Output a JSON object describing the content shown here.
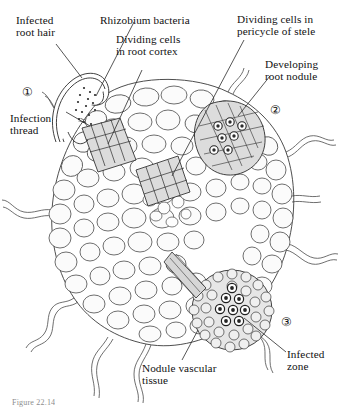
{
  "figure": {
    "domain": "biological-diagram",
    "caption": "Figure 22.14",
    "line_color": "#2b2b2b",
    "cell_fill": "#f2f2f2",
    "shaded_fill": "#d8d8d8",
    "bacteroid_fill": "#3a3a3a",
    "background": "#ffffff"
  },
  "labels": {
    "infected_root_hair": {
      "line1": "Infected",
      "line2": "root hair"
    },
    "rhizobium_bacteria": {
      "italic": "Rhizobium",
      "roman": " bacteria"
    },
    "dividing_cells_cortex": {
      "line1": "Dividing cells",
      "line2": "in root cortex"
    },
    "dividing_cells_pericycle": {
      "line1": "Dividing cells in",
      "line2": "pericycle of stele"
    },
    "developing_root_nodule": {
      "line1": "Developing",
      "line2": "root nodule"
    },
    "infection_thread": {
      "line1": "Infection",
      "line2": "thread"
    },
    "infected_zone": {
      "line1": "Infected",
      "line2": "zone"
    },
    "nodule_vascular_tissue": {
      "line1": "Nodule vascular",
      "line2": "tissue"
    }
  },
  "stage_markers": [
    {
      "id": "stage-1",
      "glyph": "①"
    },
    {
      "id": "stage-2",
      "glyph": "②"
    },
    {
      "id": "stage-3",
      "glyph": "③"
    }
  ]
}
